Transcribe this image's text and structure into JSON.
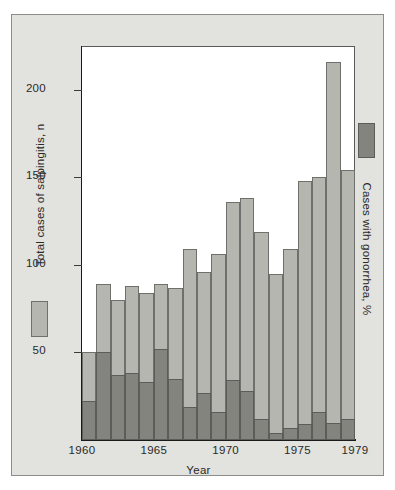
{
  "chart_data": {
    "type": "bar",
    "title": "",
    "subtitle": "",
    "xlabel": "Year",
    "ylabel": "Total cases of salpingitis, n",
    "y2label": "Cases with gonorrhea, %",
    "grid": false,
    "legend_position": "left-and-right-margins",
    "ylim": [
      0,
      225
    ],
    "y_ticks": [
      50,
      100,
      150,
      200
    ],
    "y_tick_labels": [
      "50",
      "100",
      "150",
      "200"
    ],
    "x_ticks": [
      1960,
      1965,
      1970,
      1975,
      1979
    ],
    "x_tick_labels": [
      "1960",
      "1965",
      "1970",
      "1975",
      "1979"
    ],
    "xlim": [
      1960,
      1979
    ],
    "categories": [
      1960,
      1961,
      1962,
      1963,
      1964,
      1965,
      1966,
      1967,
      1968,
      1969,
      1970,
      1971,
      1972,
      1973,
      1974,
      1975,
      1976,
      1977,
      1978
    ],
    "series": [
      {
        "name": "Total cases of salpingitis, n",
        "color": "#b6b6b0",
        "values": [
          50,
          89,
          80,
          88,
          84,
          89,
          87,
          109,
          96,
          106,
          136,
          138,
          119,
          95,
          109,
          148,
          150,
          216,
          154
        ]
      },
      {
        "name": "Cases with gonorrhea, %",
        "color": "#84847e",
        "values": [
          22,
          50,
          37,
          38,
          33,
          52,
          35,
          19,
          27,
          16,
          34,
          28,
          12,
          4,
          7,
          9,
          16,
          10,
          12
        ]
      }
    ],
    "bar_count": 19
  },
  "legend": {
    "left": {
      "label": "Total cases of salpingitis, n",
      "swatch_color": "#b6b6b0"
    },
    "right": {
      "label": "Cases with gonorrhea, %",
      "swatch_color": "#84847e"
    }
  },
  "axes": {
    "x_title": "Year"
  },
  "colors": {
    "panel_background": "#e2e2de",
    "plot_background": "#ffffff",
    "axis_line": "#1a1a1a",
    "total_bar": "#b6b6b0",
    "gonorrhea_bar": "#84847e",
    "text": "#2a2a28"
  }
}
